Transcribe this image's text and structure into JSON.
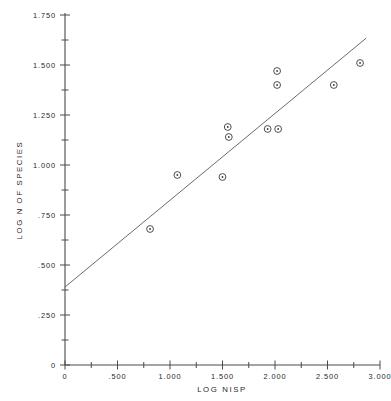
{
  "chart_data": {
    "type": "scatter",
    "title": "",
    "xlabel": "LOG NISP",
    "ylabel": "LOG N OF SPECIES",
    "xlim": [
      0,
      3.0
    ],
    "ylim": [
      0,
      1.75
    ],
    "grid": false,
    "legend": null,
    "x_ticks": [
      {
        "value": 0,
        "label": "0",
        "major": true
      },
      {
        "value": 0.25,
        "label": "",
        "major": false
      },
      {
        "value": 0.5,
        "label": ".500",
        "major": true
      },
      {
        "value": 0.75,
        "label": "",
        "major": false
      },
      {
        "value": 1.0,
        "label": "1.000",
        "major": true
      },
      {
        "value": 1.25,
        "label": "",
        "major": false
      },
      {
        "value": 1.5,
        "label": "1.500",
        "major": true
      },
      {
        "value": 1.75,
        "label": "",
        "major": false
      },
      {
        "value": 2.0,
        "label": "2.000",
        "major": true
      },
      {
        "value": 2.25,
        "label": "",
        "major": false
      },
      {
        "value": 2.5,
        "label": "2.500",
        "major": true
      },
      {
        "value": 2.75,
        "label": "",
        "major": false
      },
      {
        "value": 3.0,
        "label": "3.000",
        "major": true
      }
    ],
    "y_ticks": [
      {
        "value": 0,
        "label": "0",
        "major": true
      },
      {
        "value": 0.125,
        "label": "",
        "major": false
      },
      {
        "value": 0.25,
        "label": ".250",
        "major": true
      },
      {
        "value": 0.375,
        "label": "",
        "major": false
      },
      {
        "value": 0.5,
        "label": ".500",
        "major": true
      },
      {
        "value": 0.625,
        "label": "",
        "major": false
      },
      {
        "value": 0.75,
        "label": ".750",
        "major": true
      },
      {
        "value": 0.875,
        "label": "",
        "major": false
      },
      {
        "value": 1.0,
        "label": "1.000",
        "major": true
      },
      {
        "value": 1.125,
        "label": "",
        "major": false
      },
      {
        "value": 1.25,
        "label": "1.250",
        "major": true
      },
      {
        "value": 1.375,
        "label": "",
        "major": false
      },
      {
        "value": 1.5,
        "label": "1.500",
        "major": true
      },
      {
        "value": 1.625,
        "label": "",
        "major": false
      },
      {
        "value": 1.75,
        "label": "1.750",
        "major": true
      }
    ],
    "points": [
      {
        "x": 0.81,
        "y": 0.68
      },
      {
        "x": 1.07,
        "y": 0.95
      },
      {
        "x": 1.5,
        "y": 0.94
      },
      {
        "x": 1.55,
        "y": 1.19
      },
      {
        "x": 1.56,
        "y": 1.14
      },
      {
        "x": 1.93,
        "y": 1.18
      },
      {
        "x": 2.03,
        "y": 1.18
      },
      {
        "x": 2.02,
        "y": 1.47
      },
      {
        "x": 2.02,
        "y": 1.4
      },
      {
        "x": 2.56,
        "y": 1.4
      },
      {
        "x": 2.81,
        "y": 1.51
      }
    ],
    "fit_line": {
      "name": "regression-line",
      "x_start": 0.0,
      "y_start": 0.39,
      "x_end": 2.87,
      "y_end": 1.635
    },
    "marker": "circle-with-center-dot",
    "colors": {
      "axis": "#4a4a4a",
      "marker": "#3a3a3a",
      "fit_line": "#6b6b6b",
      "text": "#1f1f1f",
      "background": "#ffffff"
    }
  }
}
